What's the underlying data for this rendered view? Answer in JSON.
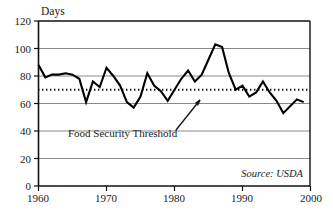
{
  "chart_data": {
    "type": "line",
    "title": "",
    "xlabel": "",
    "ylabel": "Days",
    "xlim": [
      1960,
      2000
    ],
    "ylim": [
      0,
      120
    ],
    "grid": true,
    "legend_position": "none",
    "x_ticks": [
      "1960",
      "1970",
      "1980",
      "1990",
      "2000"
    ],
    "y_ticks": [
      "0",
      "20",
      "40",
      "60",
      "80",
      "100",
      "120"
    ],
    "x_tick_values": [
      1960,
      1970,
      1980,
      1990,
      2000
    ],
    "y_tick_values": [
      0,
      20,
      40,
      60,
      80,
      100,
      120
    ],
    "series": [
      {
        "name": "Days of supply",
        "x": [
          1960,
          1961,
          1962,
          1963,
          1964,
          1965,
          1966,
          1967,
          1968,
          1969,
          1970,
          1971,
          1972,
          1973,
          1974,
          1975,
          1976,
          1977,
          1978,
          1979,
          1980,
          1981,
          1982,
          1983,
          1984,
          1985,
          1986,
          1987,
          1988,
          1989,
          1990,
          1991,
          1992,
          1993,
          1994,
          1995,
          1996,
          1997,
          1998,
          1999
        ],
        "values": [
          88,
          79,
          81,
          81,
          82,
          81,
          78,
          61,
          76,
          72,
          86,
          80,
          73,
          61,
          57,
          65,
          82,
          73,
          69,
          62,
          70,
          78,
          84,
          76,
          81,
          92,
          103,
          101,
          82,
          70,
          73,
          65,
          68,
          76,
          68,
          62,
          53,
          58,
          63,
          61
        ]
      }
    ],
    "threshold": {
      "label": "Food Security Threshold",
      "value": 70
    },
    "annotations": [
      {
        "text": "Food Security Threshold",
        "points_to_value": 70
      },
      {
        "text": "Source: USDA"
      }
    ],
    "source": "Source: USDA"
  },
  "axis": {
    "y_title": "Days"
  },
  "colors": {
    "series": "#000000",
    "grid": "#8a8a8a",
    "axis": "#111111",
    "background": "#ffffff"
  }
}
